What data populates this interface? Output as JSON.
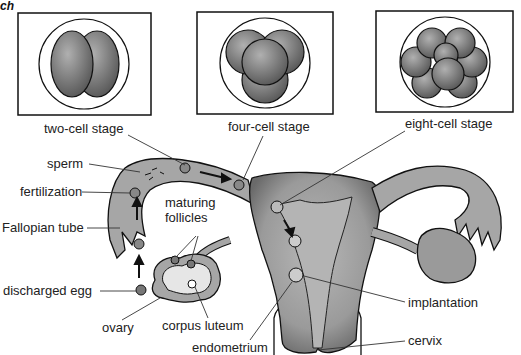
{
  "corner_text": "ch",
  "stages": [
    {
      "label": "two-cell stage",
      "cells": 2
    },
    {
      "label": "four-cell stage",
      "cells": 4
    },
    {
      "label": "eight-cell stage",
      "cells": 8
    }
  ],
  "labels": {
    "sperm": "sperm",
    "fertilization": "fertilization",
    "fallopian_tube": "Fallopian tube",
    "discharged_egg": "discharged egg",
    "maturing_line1": "maturing",
    "maturing_line2": "follicles",
    "ovary": "ovary",
    "corpus_luteum": "corpus luteum",
    "endometrium": "endometrium",
    "implantation": "implantation",
    "cervix": "cervix"
  },
  "colors": {
    "tissue": "#a8a8a8",
    "tissue_dark": "#6e6e6e",
    "cell": "#7a7a7a",
    "outline": "#1a1a1a",
    "text": "#222222"
  }
}
